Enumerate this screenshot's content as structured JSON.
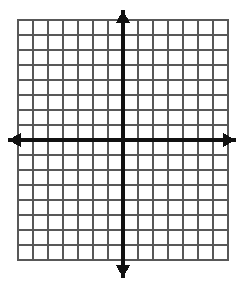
{
  "figure": {
    "name": "blank-cartesian-coordinate-grid",
    "title": "",
    "background_color": "#ffffff",
    "width": 240,
    "height": 286
  },
  "chart_data": {
    "type": "scatter",
    "title": "",
    "subtitle": "",
    "xlabel": "",
    "ylabel": "",
    "series": [
      {
        "name": "",
        "x": [],
        "y": []
      }
    ],
    "x": [],
    "values": [],
    "categories": [],
    "xlim": [
      -7,
      7
    ],
    "ylim": [
      -8,
      8
    ],
    "xticks": [
      -7,
      -6,
      -5,
      -4,
      -3,
      -2,
      -1,
      0,
      1,
      2,
      3,
      4,
      5,
      6,
      7
    ],
    "yticks": [
      -8,
      -7,
      -6,
      -5,
      -4,
      -3,
      -2,
      -1,
      0,
      1,
      2,
      3,
      4,
      5,
      6,
      7,
      8
    ],
    "xtick_labels": [],
    "ytick_labels": [],
    "grid": true,
    "legend": false,
    "legend_position": "none",
    "annotations": []
  },
  "grid": {
    "columns": 14,
    "rows": 16,
    "cell_size": 15,
    "left": 18,
    "top": 20,
    "right": 228,
    "bottom": 260,
    "line_color": "#585858",
    "line_width": 1.4,
    "border_color": "#585858",
    "border_width": 1.4
  },
  "axes": {
    "color": "#111111",
    "line_width": 3.2,
    "origin_x": 123,
    "origin_y": 140,
    "x_axis": {
      "name": "x-axis",
      "label": "",
      "start_x": 8,
      "end_x": 236,
      "y": 140,
      "arrow_left": true,
      "arrow_right": true
    },
    "y_axis": {
      "name": "y-axis",
      "label": "",
      "x": 123,
      "start_y": 10,
      "end_y": 278,
      "arrow_up": true,
      "arrow_down": true
    },
    "arrowhead": {
      "length": 13,
      "half_width": 7
    }
  }
}
